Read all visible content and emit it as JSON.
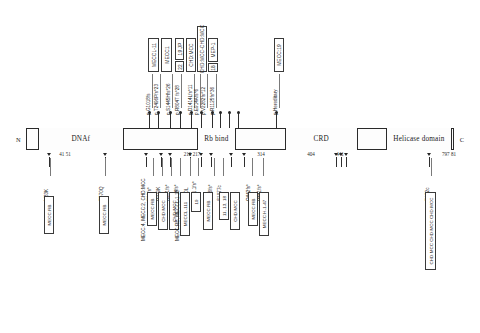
{
  "figure": {
    "type": "protein-domain-mutation-map",
    "protein_length": 7978,
    "terminus_left": "N",
    "terminus_right": "C"
  },
  "bar": {
    "domains": [
      {
        "name": "DNA binding",
        "label": "DNAf",
        "start_pct": 3.0,
        "end_pct": 22.5
      },
      {
        "name": "Rb bind",
        "label": "Rb bind",
        "start_pct": 41.0,
        "end_pct": 48.0
      },
      {
        "name": "CRD",
        "label": "CRD",
        "start_pct": 61.5,
        "end_pct": 82.5
      },
      {
        "name": "Helicase domain",
        "label": "Helicase domain",
        "start_pct": 96.0,
        "end_pct": 99.0
      }
    ],
    "boundaries": [
      {
        "label": "41 51",
        "pct": 14.0
      },
      {
        "label": "210 217",
        "pct": 42.5
      },
      {
        "label": "314",
        "pct": 61.0
      },
      {
        "label": "404",
        "pct": 77.0
      },
      {
        "label": "441",
        "pct": 84.0
      },
      {
        "label": "797 81",
        "pct": 99.2
      }
    ]
  },
  "segments": [
    {
      "id": "dna",
      "label": "DNAf",
      "left_pct": 2.8,
      "width_pct": 20.0
    },
    {
      "id": "rb",
      "label": "Rb bind",
      "left_pct": 40.0,
      "width_pct": 9.0
    },
    {
      "id": "crd",
      "label": "CRD",
      "left_pct": 60.5,
      "width_pct": 17.0
    },
    {
      "id": "helicase",
      "label": "Helicase domain",
      "left_pct": 84.0,
      "width_pct": 15.6
    }
  ],
  "residue_numbers": [
    {
      "text": "41 51",
      "left_px": 65
    },
    {
      "text": "210 217",
      "left_px": 192
    },
    {
      "text": "314",
      "left_px": 261
    },
    {
      "text": "404",
      "left_px": 311
    },
    {
      "text": "441",
      "left_px": 340
    },
    {
      "text": "797 81",
      "left_px": 449
    }
  ],
  "upper_mutations": [
    {
      "text": "p.G1018fs",
      "x": 151
    },
    {
      "text": "p.T2496Pfs*23",
      "x": 159
    },
    {
      "text": "p.S1445Hfs*26",
      "x": 171
    },
    {
      "text": "p.R804T fs*28",
      "x": 180
    },
    {
      "text": "p.D1414Lfs*11",
      "x": 193
    },
    {
      "text": "p.E914Afs*6",
      "x": 199
    },
    {
      "text": "p.V2282fs*12",
      "x": 206
    },
    {
      "text": "p.R1125fs*36",
      "x": 215
    },
    {
      "text": "p.Hereditary",
      "x": 278
    }
  ],
  "upper_boxes": [
    {
      "label": "MECCL-11",
      "x": 148,
      "y": 38,
      "w": 11,
      "h": 34
    },
    {
      "label": "MECC1",
      "x": 161,
      "y": 38,
      "w": 11,
      "h": 34
    },
    {
      "label": "19 JP",
      "x": 175,
      "y": 38,
      "w": 9,
      "h": 22
    },
    {
      "label": "22",
      "x": 175,
      "y": 61,
      "w": 9,
      "h": 11
    },
    {
      "label": "CHD:MCC",
      "x": 186,
      "y": 38,
      "w": 10,
      "h": 34
    },
    {
      "label": "CHD:MCC-CHD:MCC",
      "x": 197,
      "y": 26,
      "w": 10,
      "h": 46
    },
    {
      "label": "MEP-1",
      "x": 208,
      "y": 38,
      "w": 10,
      "h": 24
    },
    {
      "label": "18",
      "x": 208,
      "y": 63,
      "w": 10,
      "h": 9
    },
    {
      "label": "MECC:19",
      "x": 274,
      "y": 38,
      "w": 10,
      "h": 34
    }
  ],
  "lower_mutations": [
    {
      "text": "M83K",
      "x": 49
    },
    {
      "text": "E570Q",
      "x": 104
    },
    {
      "text": "E89fs*",
      "x": 152
    },
    {
      "text": "R279K",
      "x": 161
    },
    {
      "text": "R371fs*",
      "x": 170
    },
    {
      "text": "R344fs*",
      "x": 179
    },
    {
      "text": "E440L",
      "x": 189
    },
    {
      "text": "L441.1fs*",
      "x": 197
    },
    {
      "text": "D386fs*",
      "x": 213
    },
    {
      "text": "S1977c",
      "x": 222
    },
    {
      "text": "Q442fs*",
      "x": 251
    },
    {
      "text": "R441fs*",
      "x": 262
    },
    {
      "text": "R172c",
      "x": 430
    }
  ],
  "lower_boxes": [
    {
      "label": "MECC:RB",
      "x": 44,
      "y": 196,
      "w": 10,
      "h": 38
    },
    {
      "label": "MECC:RB",
      "x": 99,
      "y": 196,
      "w": 10,
      "h": 38
    },
    {
      "label": "MECC:RB",
      "x": 147,
      "y": 192,
      "w": 10,
      "h": 34
    },
    {
      "label": "CHD:MCC",
      "x": 158,
      "y": 192,
      "w": 10,
      "h": 38
    },
    {
      "label": "CHD:MCC",
      "x": 169,
      "y": 192,
      "w": 10,
      "h": 38
    },
    {
      "label": "MECCL-111",
      "x": 180,
      "y": 192,
      "w": 10,
      "h": 44
    },
    {
      "label": "19",
      "x": 191,
      "y": 192,
      "w": 10,
      "h": 20
    },
    {
      "label": "MECC:RB",
      "x": 203,
      "y": 192,
      "w": 10,
      "h": 38
    },
    {
      "label": "11, 13, 18",
      "x": 219,
      "y": 192,
      "w": 10,
      "h": 28
    },
    {
      "label": "CHD:MCC",
      "x": 230,
      "y": 192,
      "w": 10,
      "h": 38
    },
    {
      "label": "MECC:RB",
      "x": 248,
      "y": 192,
      "w": 10,
      "h": 34
    },
    {
      "label": "MECC:H-1-47",
      "x": 259,
      "y": 192,
      "w": 10,
      "h": 44
    },
    {
      "label": "CHD:MCC CHD:MCC CHD:MCC",
      "x": 425,
      "y": 192,
      "w": 11,
      "h": 78
    }
  ],
  "lower_box_side_labels": [
    {
      "text": "MECC:4, MECC:2, CHD:MCC",
      "x": 146,
      "y": 236
    },
    {
      "text": "MECC:RB, MECCL-1 11",
      "x": 180,
      "y": 236
    }
  ],
  "upper_ticks_pct": [
    28.8,
    30.9,
    33.7,
    36.0,
    38.5,
    41.0,
    43.4,
    45.3,
    47.4,
    49.6,
    58.3
  ],
  "lower_ticks_pct": [
    5.3,
    18.5,
    28.1,
    31.5,
    33.7,
    38.3,
    40.9,
    43.2,
    48.0,
    51.0,
    72.5,
    73.6,
    74.7,
    94.2
  ],
  "colors": {
    "bar_stroke": "#2a2a2a",
    "bar_fill": "#fdfdfd",
    "tick": "#2e2e2e",
    "text": "#1e1e1e",
    "leader": "#7a7a7a"
  }
}
